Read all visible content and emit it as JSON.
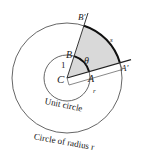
{
  "diagram": {
    "labels": {
      "center": "C",
      "inner_start": "A",
      "inner_end": "B",
      "outer_start": "A′",
      "outer_end": "B′",
      "angle": "θ",
      "inner_radius": "1",
      "outer_radius": "r",
      "arc_length": "s"
    },
    "captions": {
      "unit_circle": "Unit circle",
      "outer_circle": "Circle of radius r"
    },
    "geometry": {
      "center": [
        67,
        78
      ],
      "inner_radius_px": 23,
      "outer_radius_px": 55,
      "ray_CA_angle_deg": 16,
      "ray_CB_angle_deg": 72
    },
    "colors": {
      "stroke": "#333333",
      "sector_fill": "#d9d9d9",
      "arc_highlight": "#111111"
    }
  }
}
